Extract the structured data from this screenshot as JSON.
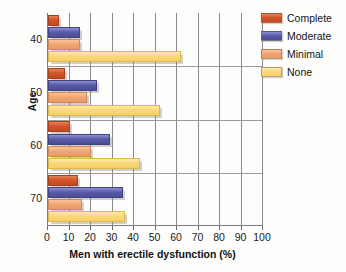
{
  "chart_data": {
    "type": "bar",
    "orientation": "horizontal",
    "title": "",
    "xlabel": "Men with erectile dysfunction (%)",
    "ylabel": "Age",
    "categories": [
      "40",
      "50",
      "60",
      "70"
    ],
    "xlim": [
      0,
      100
    ],
    "xticks": [
      "0",
      "10",
      "20",
      "30",
      "40",
      "50",
      "60",
      "70",
      "80",
      "90",
      "100"
    ],
    "grid": true,
    "legend_position": "top-right",
    "series": [
      {
        "name": "Complete",
        "color": "#d4552b",
        "values": [
          5,
          8,
          10,
          14
        ]
      },
      {
        "name": "Moderate",
        "color": "#5a5ba8",
        "values": [
          15,
          23,
          29,
          35
        ]
      },
      {
        "name": "Minimal",
        "color": "#efa773",
        "values": [
          15,
          18,
          20,
          16
        ]
      },
      {
        "name": "None",
        "color": "#fbd878",
        "values": [
          62,
          52,
          43,
          36
        ]
      }
    ]
  },
  "axes": {
    "y_title": "Age",
    "x_title": "Men with erectile dysfunction (%)",
    "y_ticks": [
      "40",
      "50",
      "60",
      "70"
    ],
    "x_ticks": [
      "0",
      "10",
      "20",
      "30",
      "40",
      "50",
      "60",
      "70",
      "80",
      "90",
      "100"
    ]
  },
  "legend": {
    "items": [
      {
        "label": "Complete"
      },
      {
        "label": "Moderate"
      },
      {
        "label": "Minimal"
      },
      {
        "label": "None"
      }
    ]
  }
}
